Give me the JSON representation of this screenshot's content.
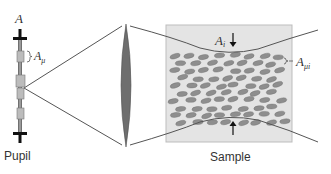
{
  "diagram": {
    "type": "optical-schematic",
    "labels": {
      "pupil": "Pupil",
      "sample": "Sample",
      "aperture_main": "A",
      "aperture_micro_base": "A",
      "aperture_micro_sub": "μ",
      "aperture_illum_base": "A",
      "aperture_illum_sub": "i",
      "aperture_sample_micro_base": "A",
      "aperture_sample_micro_sub": "μi"
    },
    "components": [
      {
        "name": "pupil",
        "description": "Vertical pupil bar with sub-aperture rectangles"
      },
      {
        "name": "lens",
        "description": "Biconvex lens focusing the beam"
      },
      {
        "name": "sample",
        "description": "Scattering sample with ellipsoidal scatterers"
      }
    ],
    "colors": {
      "line": "#555555",
      "bar": "#111111",
      "lens": "#6e6e6e",
      "sample_bg": "#e4e4e4",
      "sample_border": "#bdbdbd",
      "scatterer": "#8e8e8e",
      "subaperture": "#bcbcbc"
    }
  }
}
